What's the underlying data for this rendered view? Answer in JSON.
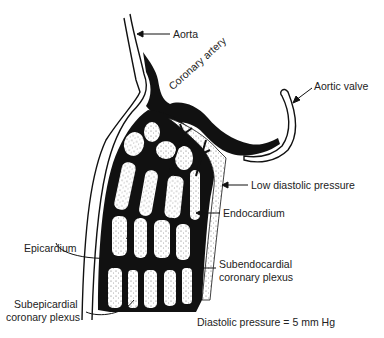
{
  "diagram": {
    "type": "anatomical cross-section",
    "colors": {
      "ink": "#111111",
      "background": "#ffffff",
      "stipple": "#444444"
    },
    "labels": {
      "aorta": "Aorta",
      "coronary_artery": "Coronary artery",
      "aortic_valve": "Aortic valve",
      "low_diastolic_pressure": "Low diastolic pressure",
      "endocardium": "Endocardium",
      "epicardium": "Epicardium",
      "subendocardial_line1": "Subendocardial",
      "subendocardial_line2": "coronary plexus",
      "subepicardial_line1": "Subepicardial",
      "subepicardial_line2": "coronary plexus",
      "diastolic_pressure": "Diastolic pressure  =  5 mm Hg"
    }
  }
}
